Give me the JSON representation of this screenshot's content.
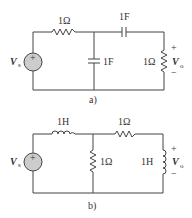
{
  "circuits": [
    {
      "caption": "a)",
      "source": {
        "label": "V",
        "sub": "s",
        "sign": "+"
      },
      "series_resistor": "1Ω",
      "shunt_capacitor": "1F",
      "series_capacitor": "1F",
      "load_resistor": "1Ω",
      "output": {
        "label": "V",
        "sub": "o",
        "plus": "+",
        "minus": "−"
      }
    },
    {
      "caption": "b)",
      "source": {
        "label": "V",
        "sub": "s",
        "sign": "+"
      },
      "series_inductor": "1H",
      "shunt_resistor": "1Ω",
      "series_resistor": "1Ω",
      "load_inductor": "1H",
      "output": {
        "label": "V",
        "sub": "o",
        "plus": "+",
        "minus": "−"
      }
    }
  ]
}
